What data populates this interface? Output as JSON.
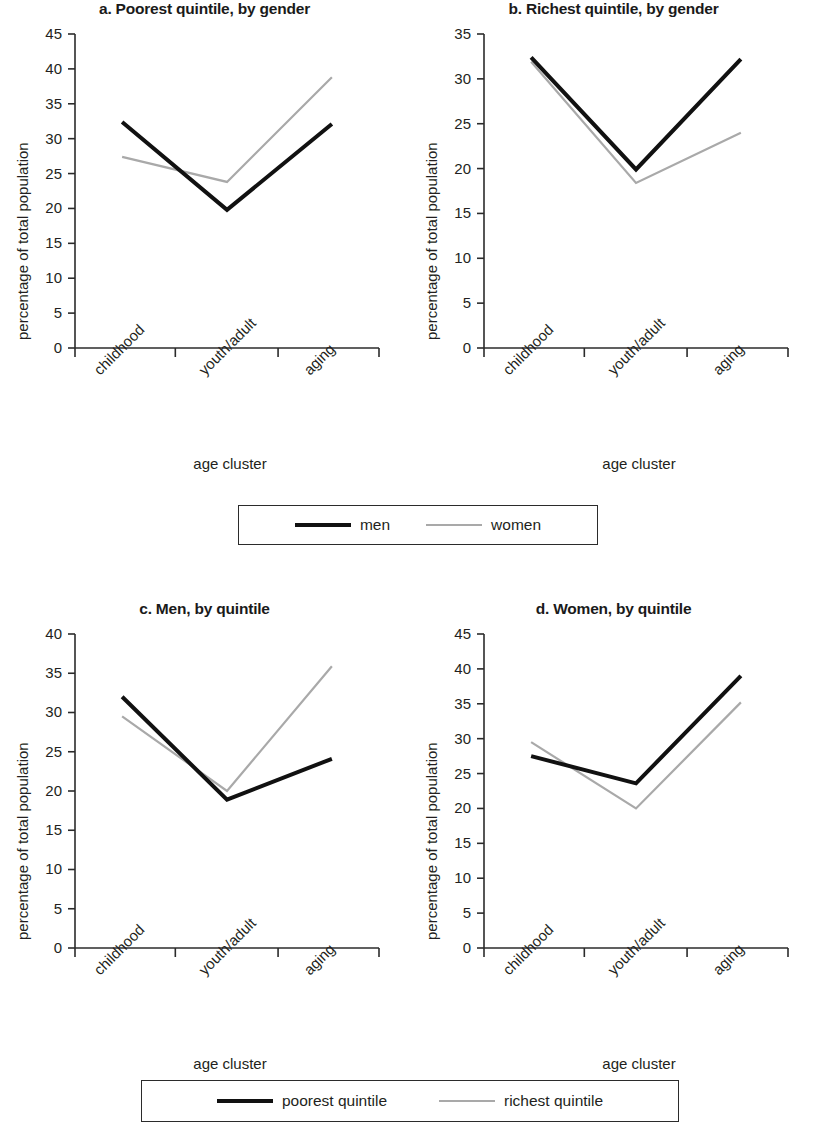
{
  "figure": {
    "axis_title_x": "age cluster",
    "axis_title_y": "percentage of total population"
  },
  "legends": [
    {
      "name": "gender-legend",
      "items": [
        {
          "label": "men",
          "color": "#111111",
          "style": "thick-black"
        },
        {
          "label": "women",
          "color": "#a9a9a9",
          "style": "thin-gray"
        }
      ]
    },
    {
      "name": "quintile-legend",
      "items": [
        {
          "label": "poorest quintile",
          "color": "#111111",
          "style": "thick-black"
        },
        {
          "label": "richest quintile",
          "color": "#a9a9a9",
          "style": "thin-gray"
        }
      ]
    }
  ],
  "chart_data": [
    {
      "type": "line",
      "panel": "a",
      "title": "a. Poorest quintile, by gender",
      "xlabel": "age cluster",
      "ylabel": "percentage of total population",
      "categories": [
        "childhood",
        "youth/adult",
        "aging"
      ],
      "ylim": [
        0,
        45
      ],
      "yticks": [
        0,
        5,
        10,
        15,
        20,
        25,
        30,
        35,
        40,
        45
      ],
      "grid": false,
      "legend_position": "below-figure",
      "series": [
        {
          "name": "men",
          "color": "#111111",
          "values": [
            32.4,
            19.8,
            32.1
          ]
        },
        {
          "name": "women",
          "color": "#a9a9a9",
          "values": [
            27.4,
            23.8,
            38.8
          ]
        }
      ]
    },
    {
      "type": "line",
      "panel": "b",
      "title": "b. Richest quintile, by gender",
      "xlabel": "age cluster",
      "ylabel": "percentage of total population",
      "categories": [
        "childhood",
        "youth/adult",
        "aging"
      ],
      "ylim": [
        0,
        35
      ],
      "yticks": [
        0,
        5,
        10,
        15,
        20,
        25,
        30,
        35
      ],
      "grid": false,
      "legend_position": "below-figure",
      "series": [
        {
          "name": "men",
          "color": "#111111",
          "values": [
            32.4,
            19.9,
            32.2
          ]
        },
        {
          "name": "women",
          "color": "#a9a9a9",
          "values": [
            31.9,
            18.4,
            24.0
          ]
        }
      ]
    },
    {
      "type": "line",
      "panel": "c",
      "title": "c. Men, by quintile",
      "xlabel": "age cluster",
      "ylabel": "percentage of total population",
      "categories": [
        "childhood",
        "youth/adult",
        "aging"
      ],
      "ylim": [
        0,
        40
      ],
      "yticks": [
        0,
        5,
        10,
        15,
        20,
        25,
        30,
        35,
        40
      ],
      "grid": false,
      "legend_position": "below-figure",
      "series": [
        {
          "name": "poorest quintile",
          "color": "#111111",
          "values": [
            32.0,
            18.9,
            24.1
          ]
        },
        {
          "name": "richest quintile",
          "color": "#a9a9a9",
          "values": [
            29.5,
            20.0,
            35.9
          ]
        }
      ]
    },
    {
      "type": "line",
      "panel": "d",
      "title": "d. Women, by quintile",
      "xlabel": "age cluster",
      "ylabel": "percentage of total population",
      "categories": [
        "childhood",
        "youth/adult",
        "aging"
      ],
      "ylim": [
        0,
        45
      ],
      "yticks": [
        0,
        5,
        10,
        15,
        20,
        25,
        30,
        35,
        40,
        45
      ],
      "grid": false,
      "legend_position": "below-figure",
      "series": [
        {
          "name": "poorest quintile",
          "color": "#111111",
          "values": [
            27.5,
            23.6,
            39.0
          ]
        },
        {
          "name": "richest quintile",
          "color": "#a9a9a9",
          "values": [
            29.5,
            20.0,
            35.2
          ]
        }
      ]
    }
  ]
}
